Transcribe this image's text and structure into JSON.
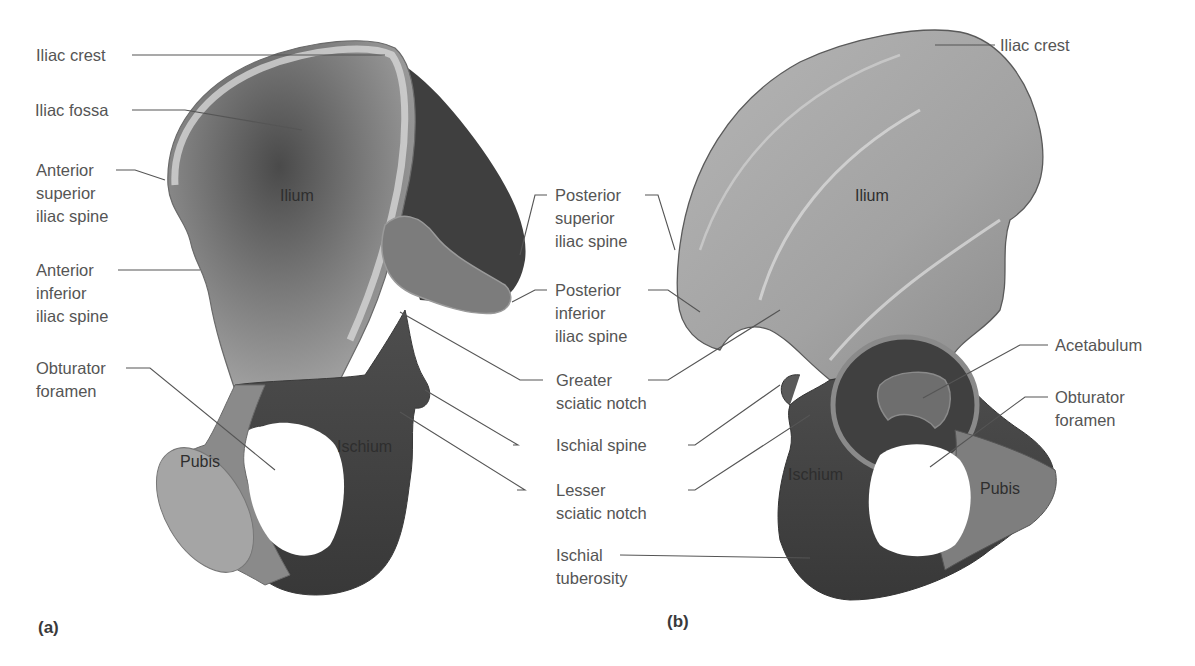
{
  "figure": {
    "panels": [
      {
        "id": "a",
        "label": "(a)"
      },
      {
        "id": "b",
        "label": "(b)"
      }
    ],
    "colors": {
      "background": "#ffffff",
      "label_text": "#555555",
      "leader_line": "#555555",
      "bone_light": "#c9c9c9",
      "bone_mid": "#9a9a9a",
      "bone_dark": "#555555",
      "bone_darkest": "#3a3a3a"
    }
  },
  "panel_a": {
    "region_labels": {
      "ilium": "Ilium",
      "ischium": "Ischium",
      "pubis": "Pubis"
    },
    "callouts": [
      {
        "id": "iliac-crest",
        "text": "Iliac crest"
      },
      {
        "id": "iliac-fossa",
        "text": "Iliac fossa"
      },
      {
        "id": "asis",
        "text": "Anterior\nsuperior\niliac spine"
      },
      {
        "id": "aiis",
        "text": "Anterior\ninferior\niliac spine"
      },
      {
        "id": "obturator-foramen",
        "text": "Obturator\nforamen"
      }
    ]
  },
  "center_callouts": [
    {
      "id": "psis",
      "text": "Posterior\nsuperior\niliac spine"
    },
    {
      "id": "piis",
      "text": "Posterior\ninferior\niliac spine"
    },
    {
      "id": "greater-sciatic-notch",
      "text": "Greater\nsciatic notch"
    },
    {
      "id": "ischial-spine",
      "text": "Ischial spine"
    },
    {
      "id": "lesser-sciatic-notch",
      "text": "Lesser\nsciatic notch"
    },
    {
      "id": "ischial-tuberosity",
      "text": "Ischial\ntuberosity"
    }
  ],
  "panel_b": {
    "region_labels": {
      "ilium": "Ilium",
      "ischium": "Ischium",
      "pubis": "Pubis"
    },
    "callouts": [
      {
        "id": "iliac-crest",
        "text": "Iliac crest"
      },
      {
        "id": "acetabulum",
        "text": "Acetabulum"
      },
      {
        "id": "obturator-foramen",
        "text": "Obturator\nforamen"
      }
    ]
  }
}
